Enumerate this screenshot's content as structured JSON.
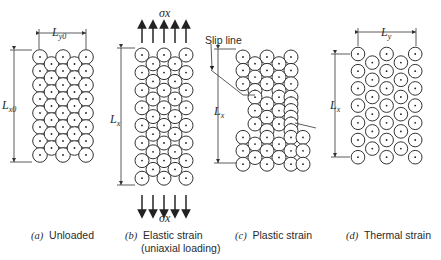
{
  "figure": {
    "panels": [
      {
        "id": "a",
        "letter": "(a)",
        "caption": "Unloaded",
        "dim_x": "L",
        "dim_x_sub": "x0",
        "dim_y": "L",
        "dim_y_sub": "y0"
      },
      {
        "id": "b",
        "letter": "(b)",
        "caption": "Elastic strain",
        "caption2": "(uniaxial loading)",
        "dim_x": "L",
        "dim_x_sub": "x",
        "stress_top": "σx",
        "stress_bottom": "σx"
      },
      {
        "id": "c",
        "letter": "(c)",
        "caption": "Plastic strain",
        "dim_x": "L",
        "dim_x_sub": "x",
        "annotation": "Slip line"
      },
      {
        "id": "d",
        "letter": "(d)",
        "caption": "Thermal strain",
        "dim_x": "L",
        "dim_x_sub": "x",
        "dim_y": "L",
        "dim_y_sub": "y"
      }
    ],
    "colors": {
      "line": "#333333",
      "background": "#ffffff"
    }
  }
}
